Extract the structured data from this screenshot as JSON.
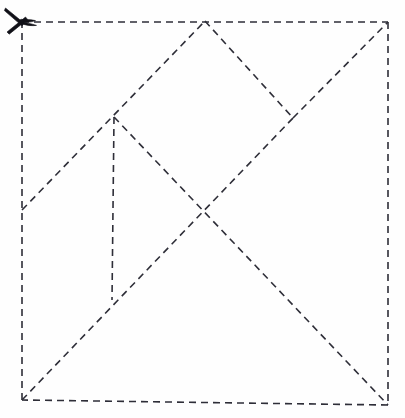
{
  "diagram": {
    "type": "fold-pattern",
    "background_color": "#fefefe",
    "line_color": "#2e2e38",
    "line_style": "dashed",
    "dash_pattern": "7 5",
    "stroke_width": 1.6,
    "canvas": {
      "width": 405,
      "height": 418
    },
    "square": {
      "label": "outer-square",
      "top_left": [
        22,
        22
      ],
      "top_right": [
        388,
        22
      ],
      "bottom_right": [
        388,
        405
      ],
      "bottom_left": [
        22,
        400
      ]
    },
    "vertices": [
      {
        "name": "top-left-corner",
        "x": 22,
        "y": 22
      },
      {
        "name": "top-apex",
        "x": 205,
        "y": 21
      },
      {
        "name": "top-right-corner",
        "x": 388,
        "y": 22
      },
      {
        "name": "left-peak",
        "x": 114,
        "y": 117
      },
      {
        "name": "right-peak",
        "x": 293,
        "y": 118
      },
      {
        "name": "left-edge-junction",
        "x": 22,
        "y": 210
      },
      {
        "name": "center-cross",
        "x": 203,
        "y": 211
      },
      {
        "name": "vertical-foot",
        "x": 112,
        "y": 300
      },
      {
        "name": "bottom-left-corner",
        "x": 22,
        "y": 400
      },
      {
        "name": "bottom-right-corner",
        "x": 388,
        "y": 405
      }
    ],
    "segments": [
      {
        "name": "square-top-edge",
        "from": [
          22,
          22
        ],
        "to": [
          388,
          22
        ]
      },
      {
        "name": "square-right-edge",
        "from": [
          388,
          22
        ],
        "to": [
          388,
          405
        ]
      },
      {
        "name": "square-bottom-edge",
        "from": [
          388,
          405
        ],
        "to": [
          22,
          400
        ]
      },
      {
        "name": "square-left-edge",
        "from": [
          22,
          400
        ],
        "to": [
          22,
          22
        ]
      },
      {
        "name": "left-diagonal-up",
        "from": [
          22,
          210
        ],
        "to": [
          205,
          21
        ]
      },
      {
        "name": "top-right-diagonal-down",
        "from": [
          205,
          21
        ],
        "to": [
          293,
          118
        ]
      },
      {
        "name": "right-diagonal-to-corner",
        "from": [
          293,
          118
        ],
        "to": [
          388,
          22
        ]
      },
      {
        "name": "main-diagonal-rising",
        "from": [
          22,
          400
        ],
        "to": [
          293,
          118
        ]
      },
      {
        "name": "main-diagonal-falling",
        "from": [
          114,
          117
        ],
        "to": [
          388,
          405
        ]
      },
      {
        "name": "vertical-fold",
        "from": [
          114,
          117
        ],
        "to": [
          112,
          300
        ]
      }
    ],
    "cut_marker": {
      "name": "scissors-icon",
      "position": [
        4,
        7
      ],
      "color": "#111118"
    }
  }
}
